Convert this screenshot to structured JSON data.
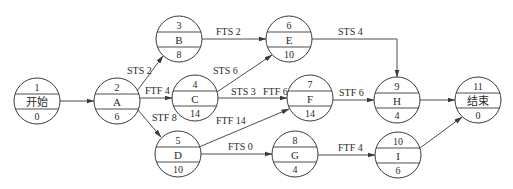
{
  "diagram": {
    "type": "precedence-network",
    "nodes": [
      {
        "id": "1",
        "name": "开始",
        "duration": "0",
        "cx": 37,
        "cy": 101
      },
      {
        "id": "2",
        "name": "A",
        "duration": "6",
        "cx": 117,
        "cy": 101
      },
      {
        "id": "3",
        "name": "B",
        "duration": "8",
        "cx": 179,
        "cy": 39
      },
      {
        "id": "4",
        "name": "C",
        "duration": "14",
        "cx": 195,
        "cy": 98
      },
      {
        "id": "5",
        "name": "D",
        "duration": "10",
        "cx": 178,
        "cy": 154
      },
      {
        "id": "6",
        "name": "E",
        "duration": "10",
        "cx": 289,
        "cy": 39
      },
      {
        "id": "7",
        "name": "F",
        "duration": "14",
        "cx": 310,
        "cy": 98
      },
      {
        "id": "8",
        "name": "G",
        "duration": "4",
        "cx": 295,
        "cy": 154
      },
      {
        "id": "9",
        "name": "H",
        "duration": "4",
        "cx": 397,
        "cy": 100
      },
      {
        "id": "10",
        "name": "I",
        "duration": "6",
        "cx": 398,
        "cy": 155
      },
      {
        "id": "11",
        "name": "结束",
        "duration": "0",
        "cx": 478,
        "cy": 100
      }
    ],
    "edges": [
      {
        "from": "1",
        "to": "2",
        "label": ""
      },
      {
        "from": "2",
        "to": "3",
        "label": "STS 2"
      },
      {
        "from": "2",
        "to": "4",
        "label": "FTF 4"
      },
      {
        "from": "2",
        "to": "5",
        "label": "STF 8"
      },
      {
        "from": "3",
        "to": "6",
        "label": "FTS 2"
      },
      {
        "from": "4",
        "to": "6",
        "label": "STS 6"
      },
      {
        "from": "4",
        "to": "7",
        "label": "STS 3  FTF 6"
      },
      {
        "from": "5",
        "to": "7",
        "label": "FTF 14"
      },
      {
        "from": "5",
        "to": "8",
        "label": "FTS 0"
      },
      {
        "from": "6",
        "to": "9",
        "label": "STS 4"
      },
      {
        "from": "7",
        "to": "9",
        "label": "STF 6"
      },
      {
        "from": "8",
        "to": "10",
        "label": "FTF 4"
      },
      {
        "from": "9",
        "to": "11",
        "label": ""
      },
      {
        "from": "10",
        "to": "11",
        "label": ""
      }
    ],
    "labels": {
      "e_2_3": "STS 2",
      "e_2_4": "FTF 4",
      "e_2_5": "STF 8",
      "e_3_6": "FTS 2",
      "e_4_6": "STS 6",
      "e_4_7_a": "STS 3",
      "e_4_7_b": "FTF 6",
      "e_5_7": "FTF 14",
      "e_5_8": "FTS 0",
      "e_6_9": "STS 4",
      "e_7_9": "STF 6",
      "e_8_10": "FTF 4"
    },
    "n": {
      "n1": {
        "id": "1",
        "name": "开始",
        "duration": "0"
      },
      "n2": {
        "id": "2",
        "name": "A",
        "duration": "6"
      },
      "n3": {
        "id": "3",
        "name": "B",
        "duration": "8"
      },
      "n4": {
        "id": "4",
        "name": "C",
        "duration": "14"
      },
      "n5": {
        "id": "5",
        "name": "D",
        "duration": "10"
      },
      "n6": {
        "id": "6",
        "name": "E",
        "duration": "10"
      },
      "n7": {
        "id": "7",
        "name": "F",
        "duration": "14"
      },
      "n8": {
        "id": "8",
        "name": "G",
        "duration": "4"
      },
      "n9": {
        "id": "9",
        "name": "H",
        "duration": "4"
      },
      "n10": {
        "id": "10",
        "name": "I",
        "duration": "6"
      },
      "n11": {
        "id": "11",
        "name": "结束",
        "duration": "0"
      }
    }
  }
}
